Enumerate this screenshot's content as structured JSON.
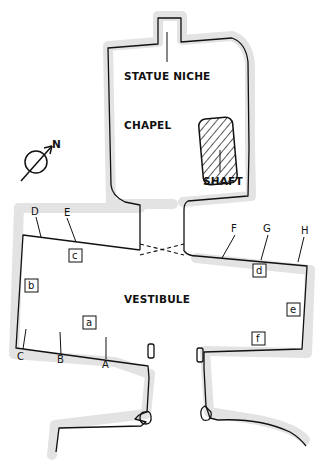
{
  "diagram": {
    "type": "architectural floor plan",
    "rooms": {
      "statue_niche": "STATUE NICHE",
      "chapel": "CHAPEL",
      "shaft": "SHAFT",
      "vestibule": "VESTIBULE"
    },
    "compass": {
      "label": "N"
    },
    "wall_markers": {
      "A": "A",
      "B": "B",
      "C": "C",
      "D": "D",
      "E": "E",
      "F": "F",
      "G": "G",
      "H": "H"
    },
    "boxed_labels": {
      "a": "a",
      "b": "b",
      "c": "c",
      "d": "d",
      "e": "e",
      "f": "f"
    },
    "colors": {
      "line": "#111111",
      "wall_shading": "#e3e3e3",
      "background": "#ffffff"
    }
  }
}
